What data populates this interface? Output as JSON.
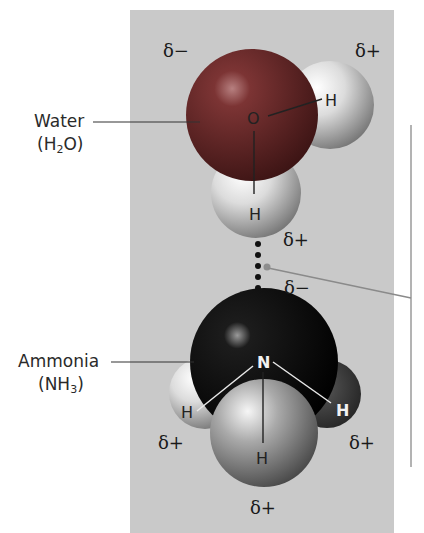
{
  "molecules": {
    "water": {
      "name": "Water",
      "formula_prefix": "(H",
      "formula_sub": "2",
      "formula_suffix": "O)",
      "atoms": {
        "center": "O",
        "h1": "H",
        "h2": "H"
      },
      "charges": {
        "oxygen": "δ−",
        "h_right": "δ+",
        "h_bottom": "δ+"
      }
    },
    "ammonia": {
      "name": "Ammonia",
      "formula_prefix": "(NH",
      "formula_sub": "3",
      "formula_suffix": ")",
      "atoms": {
        "center": "N",
        "h_left": "H",
        "h_right": "H",
        "h_bottom": "H"
      },
      "charges": {
        "nitrogen": "δ−",
        "h_left": "δ+",
        "h_right": "δ+",
        "h_bottom": "δ+"
      }
    }
  },
  "hydrogen_bond": {
    "dots": 5
  },
  "colors": {
    "panel_bg": "#c9c9c9",
    "oxygen": "#6e2a2a",
    "nitrogen": "#0c0c0c",
    "hydrogen": "#d8d8d8",
    "leader_line": "#8a8a8a"
  }
}
